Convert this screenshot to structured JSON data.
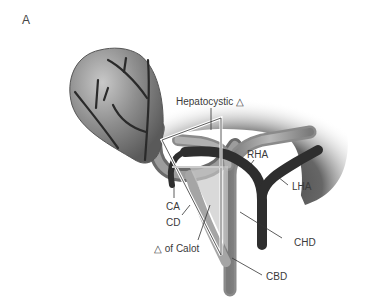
{
  "figure": {
    "panel_label": "A",
    "labels": {
      "hepatocystic": "Hepatocystic △",
      "rha": "RHA",
      "lha": "LHA",
      "ca": "CA",
      "cd": "CD",
      "calot": "△ of Calot",
      "chd": "CHD",
      "cbd": "CBD"
    },
    "colors": {
      "gallbladder": "#8a8a8a",
      "liver_shadow": "#4a4a4a",
      "artery_dark": "#2e2e2e",
      "duct_gray": "#9a9a9a",
      "triangle_outline": "#ffffff",
      "label_text": "#3a3a3a"
    }
  }
}
